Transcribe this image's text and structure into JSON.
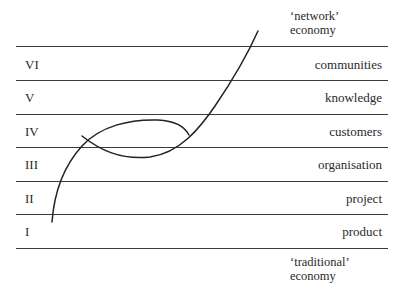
{
  "diagram": {
    "top_caption": [
      "‘network’",
      "economy"
    ],
    "bottom_caption": [
      "‘traditional’",
      "economy"
    ],
    "levels": [
      {
        "numeral": "VI",
        "label": "communities"
      },
      {
        "numeral": "V",
        "label": "knowledge"
      },
      {
        "numeral": "IV",
        "label": "customers"
      },
      {
        "numeral": "III",
        "label": "organisation"
      },
      {
        "numeral": "II",
        "label": "project"
      },
      {
        "numeral": "I",
        "label": "product"
      }
    ],
    "line_color": "#3a3a3a",
    "curve_color": "#222222"
  }
}
